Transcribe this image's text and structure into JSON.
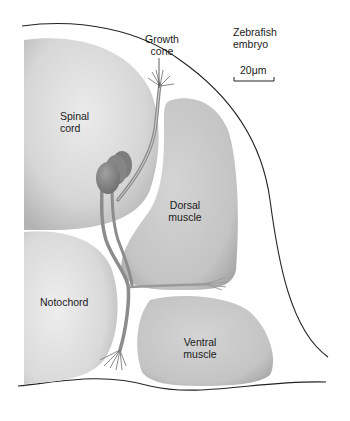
{
  "figure": {
    "title": "Zebrafish embryo",
    "title_lines": [
      "Zebrafish",
      "embryo"
    ],
    "scale_bar": {
      "label": "20μm",
      "value": 20,
      "unit": "μm"
    }
  },
  "labels": {
    "growth_cone": [
      "Growth",
      "cone"
    ],
    "spinal_cord": [
      "Spinal",
      "cord"
    ],
    "dorsal_muscle": [
      "Dorsal",
      "muscle"
    ],
    "notochord": [
      "Notochord"
    ],
    "ventral_muscle": [
      "Ventral",
      "muscle"
    ]
  },
  "structures": [
    "Spinal cord",
    "Notochord",
    "Dorsal muscle",
    "Ventral muscle",
    "Motor neuron cell bodies",
    "Axons",
    "Growth cones"
  ],
  "colors": {
    "tissue_light": "#e6e6e6",
    "tissue_mid": "#c8c8c8",
    "tissue_dark": "#a8a8a8",
    "neuron": "#8c8c8c",
    "neuron_dark": "#6f6f6f",
    "outline": "#222222",
    "text": "#1a1a1a"
  }
}
